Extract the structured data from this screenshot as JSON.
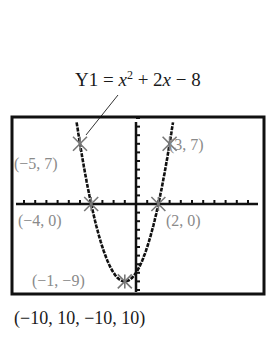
{
  "equation": {
    "prefix": "Y1 = ",
    "var": "x",
    "exp": "2",
    "rest_plus": " + 2",
    "var2": "x",
    "rest_minus": " − 8"
  },
  "window_label": "(−10, 10, −10, 10)",
  "points": [
    {
      "label": "(−5, 7)",
      "x": -5,
      "y": 7
    },
    {
      "label": "(3, 7)",
      "x": 3,
      "y": 7
    },
    {
      "label": "(−4, 0)",
      "x": -4,
      "y": 0
    },
    {
      "label": "(2, 0)",
      "x": 2,
      "y": 0
    },
    {
      "label": "(−1, −9)",
      "x": -1,
      "y": -9
    }
  ],
  "chart_data": {
    "type": "line",
    "function": "x^2 + 2x - 8",
    "xlim": [
      -10,
      10
    ],
    "ylim": [
      -10,
      10
    ],
    "window": "(-10, 10, -10, 10)",
    "labeled_points": [
      {
        "x": -5,
        "y": 7
      },
      {
        "x": 3,
        "y": 7
      },
      {
        "x": -4,
        "y": 0
      },
      {
        "x": 2,
        "y": 0
      },
      {
        "x": -1,
        "y": -9
      }
    ],
    "grid": false
  }
}
